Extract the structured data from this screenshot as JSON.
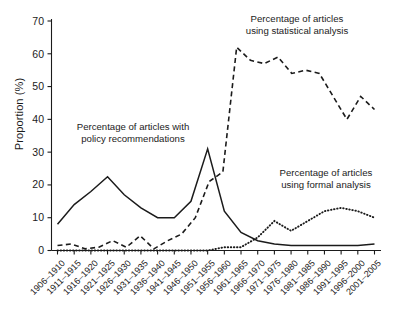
{
  "chart_data": {
    "type": "line",
    "title": "",
    "xlabel": "",
    "ylabel": "Proportion (%)",
    "ylim": [
      0,
      70
    ],
    "yticks": [
      0,
      10,
      20,
      30,
      40,
      50,
      60,
      70
    ],
    "grid": false,
    "legend_position": "inline-annotations",
    "categories": [
      "1906–1910",
      "1911–1915",
      "1916–1920",
      "1921–1925",
      "1926–1930",
      "1931–1935",
      "1936–1940",
      "1941–1945",
      "1946–1950",
      "1951–1955",
      "1956–1960",
      "1961–1965",
      "1966–1970",
      "1971–1975",
      "1976–1980",
      "1981–1985",
      "1986–1990",
      "1991–1995",
      "1996–2000",
      "2001–2005"
    ],
    "series": [
      {
        "name": "Percentage of articles with policy recommendations",
        "style": "solid",
        "color": "#1b1b1b",
        "values": [
          8,
          14,
          18,
          22.5,
          17,
          13,
          10,
          10,
          15,
          31,
          12,
          5.5,
          3,
          2,
          1.5,
          1.5,
          1.5,
          1.5,
          1.5,
          2
        ]
      },
      {
        "name": "Percentage of articles using statistical analysis",
        "style": "dashed",
        "color": "#1b1b1b",
        "values": [
          1.5,
          2,
          0.5,
          1,
          3,
          1,
          4.5,
          0.5,
          3,
          5,
          10,
          21,
          24,
          62,
          58,
          57,
          59,
          54,
          55,
          54
        ]
      },
      {
        "name": "Percentage of articles using formal analysis",
        "style": "dotted",
        "color": "#1b1b1b",
        "values": [
          0,
          0,
          0,
          0,
          0,
          0,
          0,
          0,
          0,
          0,
          1,
          1,
          4,
          9,
          6,
          9,
          12,
          13,
          12,
          10
        ]
      }
    ],
    "statistical_tail": [
      62,
      58,
      57,
      59,
      54,
      55,
      54,
      47,
      40,
      47,
      43
    ],
    "annotations": [
      {
        "id": "policy",
        "lines": [
          "Percentage of articles with",
          "policy recommendations"
        ]
      },
      {
        "id": "statistical",
        "lines": [
          "Percentage of articles",
          "using statistical analysis"
        ]
      },
      {
        "id": "formal",
        "lines": [
          "Percentage of articles",
          "using formal analysis"
        ]
      }
    ]
  }
}
